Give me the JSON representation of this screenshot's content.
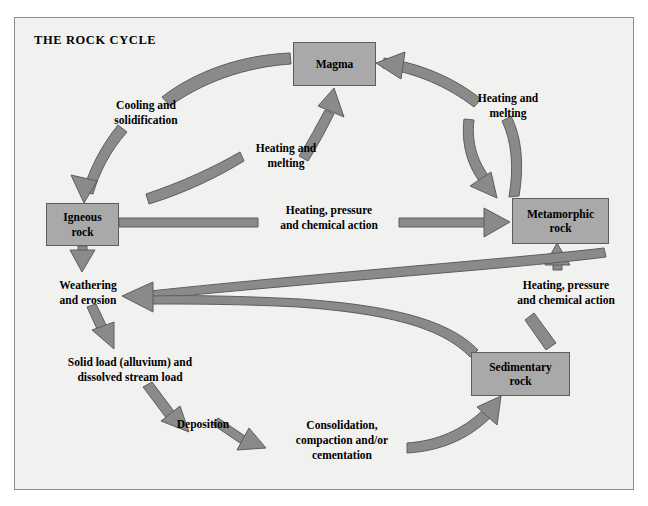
{
  "diagram": {
    "title": "THE ROCK CYCLE",
    "colors": {
      "background": "#f1f1f0",
      "frame_border": "#8d8d8d",
      "node_fill": "#a9a9a9",
      "node_border": "#5d5d5d",
      "arrow_fill": "#8a8a8a",
      "arrow_stroke": "#5d5d5d",
      "text": "#000000"
    },
    "nodes": [
      {
        "id": "magma",
        "label": "Magma",
        "lines": [
          "Magma"
        ],
        "x": 293,
        "y": 42,
        "w": 83,
        "h": 44
      },
      {
        "id": "igneous",
        "label": "Igneous rock",
        "lines": [
          "Igneous",
          "rock"
        ],
        "x": 46,
        "y": 203,
        "w": 73,
        "h": 43
      },
      {
        "id": "metamorphic",
        "label": "Metamorphic rock",
        "lines": [
          "Metamorphic",
          "rock"
        ],
        "x": 512,
        "y": 198,
        "w": 97,
        "h": 46
      },
      {
        "id": "sedimentary",
        "label": "Sedimentary rock",
        "lines": [
          "Sedimentary",
          "rock"
        ],
        "x": 471,
        "y": 352,
        "w": 99,
        "h": 44
      }
    ],
    "edges": [
      {
        "id": "cooling-solidification",
        "label": "Cooling and\nsolidification",
        "from": "magma",
        "to": "igneous",
        "label_x": 98,
        "label_y": 98,
        "label_w": 96
      },
      {
        "id": "heating-melting-igneous-to-magma",
        "label": "Heating and\nmelting",
        "from": "igneous",
        "to": "magma",
        "label_x": 240,
        "label_y": 141,
        "label_w": 92
      },
      {
        "id": "heating-melting-metamorphic-to-magma",
        "label": "Heating and\nmelting",
        "from": "metamorphic",
        "to": "magma",
        "label_x": 462,
        "label_y": 91,
        "label_w": 92
      },
      {
        "id": "heating-pressure-chemical-igneous-to-metamorphic",
        "label": "Heating, pressure\nand chemical action",
        "from": "igneous",
        "to": "metamorphic",
        "label_x": 265,
        "label_y": 203,
        "label_w": 128
      },
      {
        "id": "heating-pressure-chemical-sedimentary-to-metamorphic",
        "label": "Heating, pressure\nand chemical action",
        "from": "sedimentary",
        "to": "metamorphic",
        "label_x": 502,
        "label_y": 278,
        "label_w": 128
      },
      {
        "id": "weathering-erosion",
        "label": "Weathering\nand erosion",
        "from": "igneous",
        "to": "solid-load",
        "label_x": 42,
        "label_y": 278,
        "label_w": 92
      },
      {
        "id": "solid-load",
        "label": "Solid load (alluvium) and\ndissolved stream load",
        "from": "weathering-erosion",
        "to": "deposition",
        "label_x": 48,
        "label_y": 355,
        "label_w": 164
      },
      {
        "id": "deposition",
        "label": "Deposition",
        "from": "solid-load",
        "to": "consolidation",
        "label_x": 167,
        "label_y": 417,
        "label_w": 72
      },
      {
        "id": "consolidation",
        "label": "Consolidation,\ncompaction and/or\ncementation",
        "from": "deposition",
        "to": "sedimentary",
        "label_x": 281,
        "label_y": 418,
        "label_w": 122
      }
    ]
  }
}
